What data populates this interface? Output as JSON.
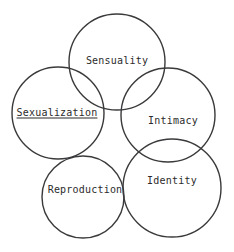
{
  "diagram": {
    "type": "venn-overlapping-circles",
    "background_color": "#ffffff",
    "stroke_color": "#3a3a3c",
    "stroke_width": 1.4,
    "text_color": "#2b2b2b",
    "canvas": {
      "width": 234,
      "height": 252
    },
    "circles": [
      {
        "id": "sensuality",
        "label": "Sensuality",
        "cx": 117,
        "cy": 62,
        "r": 48,
        "label_x": 117,
        "label_y": 60,
        "underlined": false
      },
      {
        "id": "sexualization",
        "label": "Sexualization",
        "cx": 58,
        "cy": 113,
        "r": 46,
        "label_x": 57,
        "label_y": 112,
        "underlined": true
      },
      {
        "id": "intimacy",
        "label": "Intimacy",
        "cx": 168,
        "cy": 115,
        "r": 47,
        "label_x": 173,
        "label_y": 120,
        "underlined": false
      },
      {
        "id": "reproduction",
        "label": "Reproduction",
        "cx": 83,
        "cy": 197,
        "r": 41,
        "label_x": 85,
        "label_y": 189,
        "underlined": false
      },
      {
        "id": "identity",
        "label": "Identity",
        "cx": 172,
        "cy": 188,
        "r": 49,
        "label_x": 172,
        "label_y": 180,
        "underlined": false
      }
    ]
  }
}
